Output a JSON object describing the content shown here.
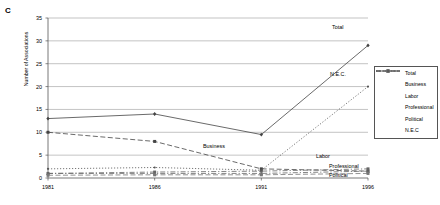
{
  "panel": {
    "label": "C"
  },
  "chart_data": {
    "type": "line",
    "title": "",
    "xlabel": "",
    "ylabel": "Number of Associations",
    "categories": [
      "1981",
      "1986",
      "1991",
      "1996"
    ],
    "x": [
      1981,
      1986,
      1991,
      1996
    ],
    "ylim": [
      0,
      35
    ],
    "ytick_values": [
      0,
      5,
      10,
      15,
      20,
      25,
      30,
      35
    ],
    "ytick_labels": [
      "0",
      "5",
      "10",
      "15",
      "20",
      "25",
      "30",
      "35"
    ],
    "grid": true,
    "legend_position": "right",
    "series": [
      {
        "name": "Total",
        "values": [
          13,
          14,
          9.5,
          29
        ],
        "marker": "diamond",
        "dash": "solid",
        "color": "#444444"
      },
      {
        "name": "Business",
        "values": [
          10,
          8,
          2,
          1.5
        ],
        "marker": "square",
        "dash": "dashed",
        "color": "#444444"
      },
      {
        "name": "Labor",
        "values": [
          1,
          1,
          1,
          1.5
        ],
        "marker": "triangle",
        "dash": "dashdot",
        "color": "#666666"
      },
      {
        "name": "Professional",
        "values": [
          1,
          1.3,
          1.5,
          2
        ],
        "marker": "square",
        "dash": "dashdot",
        "color": "#666666"
      },
      {
        "name": "Political",
        "values": [
          0.6,
          0.7,
          0.7,
          1
        ],
        "marker": "square",
        "dash": "dashed",
        "color": "#777777"
      },
      {
        "name": "N.E.C",
        "values": [
          2,
          2.3,
          1.7,
          20
        ],
        "marker": "circle",
        "dash": "dotted",
        "color": "#555555"
      }
    ],
    "annotations": [
      {
        "text": "Total",
        "x": 332,
        "y": 24
      },
      {
        "text": "N.E.C.",
        "x": 330,
        "y": 71
      },
      {
        "text": "Business",
        "x": 203,
        "y": 143
      },
      {
        "text": "Labor",
        "x": 316,
        "y": 153
      },
      {
        "text": "Professional",
        "x": 329,
        "y": 163
      },
      {
        "text": "Political",
        "x": 329,
        "y": 172
      }
    ],
    "legend": {
      "entries": [
        "Total",
        "Business",
        "Labor",
        "Professional",
        "Political",
        "N.E.C"
      ]
    }
  }
}
